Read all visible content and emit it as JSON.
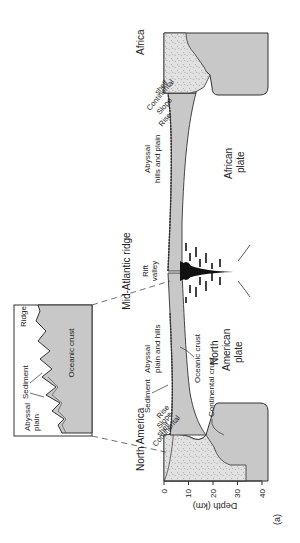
{
  "figure": {
    "panel_label": "(a)",
    "regions": {
      "left_continent": "North America",
      "right_continent": "Africa",
      "ridge": "Mid-Atlantic ridge",
      "rift_valley_line1": "Rift",
      "rift_valley_line2": "valley"
    },
    "left_margin": {
      "shelf_line1": "Continental",
      "shelf_line2": "shelf",
      "slope": "Slope",
      "rise": "Rise",
      "sediment": "Sediment",
      "abyssal_line1": "Abyssal",
      "abyssal_line2": "plain and hills",
      "oceanic_crust": "Oceanic crust",
      "continental_crust": "Continental crust",
      "plate_line1": "North",
      "plate_line2": "American",
      "plate_line3": "plate"
    },
    "right_margin": {
      "shelf_line1": "Continental",
      "shelf_line2": "shelf",
      "slope": "Slope",
      "rise": "Rise",
      "abyssal_line1": "Abyssal",
      "abyssal_line2": "hills and plain",
      "plate_line1": "African",
      "plate_line2": "plate"
    },
    "inset": {
      "ridge": "Ridge",
      "sediment": "Sediment",
      "abyssal_line1": "Abyssal",
      "abyssal_line2": "plain",
      "oceanic_crust": "Oceanic crust"
    },
    "axis": {
      "label": "Depth (km)",
      "ticks": [
        "0",
        "10",
        "20",
        "30",
        "40"
      ]
    },
    "colors": {
      "crust_fill": "#c8c8c8",
      "continental_fill": "#dcdcdc",
      "stroke": "#333333"
    }
  }
}
